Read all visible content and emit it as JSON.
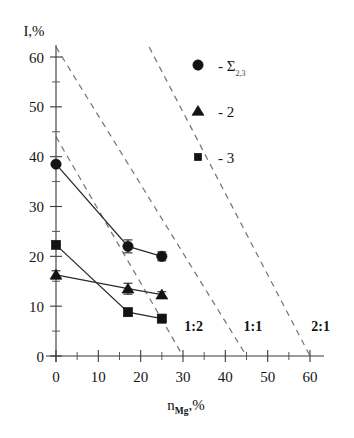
{
  "chart_data": {
    "type": "scatter",
    "title": "",
    "xlabel": "n_Mg,%",
    "xlabel_main": "n",
    "xlabel_sub": "Mg",
    "xlabel_tail": ",%",
    "ylabel": "I,%",
    "xlim": [
      0,
      60
    ],
    "ylim": [
      0,
      60
    ],
    "xticks": [
      0,
      10,
      20,
      30,
      40,
      50,
      60
    ],
    "yticks": [
      0,
      10,
      20,
      30,
      40,
      50,
      60
    ],
    "xtick_labels": [
      "0",
      "10",
      "20",
      "30",
      "40",
      "50",
      "60"
    ],
    "ytick_labels": [
      "0",
      "10",
      "20",
      "30",
      "40",
      "50",
      "60"
    ],
    "minor_tick_step": 5,
    "grid": false,
    "legend_position": "upper-right",
    "series": [
      {
        "name": "Σ",
        "name_sub": "2,3",
        "marker": "circle",
        "x": [
          0,
          17,
          25
        ],
        "values": [
          38.5,
          22.0,
          20.0
        ],
        "yerr": [
          0,
          1.3,
          0.9
        ]
      },
      {
        "name": "2",
        "marker": "triangle",
        "x": [
          0,
          17,
          25
        ],
        "values": [
          16.3,
          13.5,
          12.3
        ],
        "yerr": [
          0.8,
          1.1,
          0.6
        ]
      },
      {
        "name": "3",
        "marker": "square",
        "x": [
          0,
          17,
          25
        ],
        "values": [
          22.3,
          8.8,
          7.5
        ],
        "yerr": [
          0,
          0.7,
          0.5
        ]
      }
    ],
    "reference_lines": [
      {
        "label": "1:2",
        "x": [
          0,
          30
        ],
        "y": [
          44,
          0
        ],
        "label_x": 32.5,
        "label_y": 5.0,
        "style": "dashed"
      },
      {
        "label": "1:1",
        "x": [
          0,
          45
        ],
        "y": [
          62,
          0
        ],
        "label_x": 46.5,
        "label_y": 5.0,
        "style": "dashed"
      },
      {
        "label": "2:1",
        "x": [
          22,
          60
        ],
        "y": [
          62,
          0
        ],
        "label_x": 62.5,
        "label_y": 5.0,
        "style": "dashed"
      }
    ]
  },
  "legend": {
    "items": [
      {
        "marker": "circle",
        "dash": "-",
        "label": "Σ",
        "sub": "2,3"
      },
      {
        "marker": "triangle",
        "dash": "-",
        "label": "2",
        "sub": ""
      },
      {
        "marker": "square",
        "dash": "-",
        "label": "3",
        "sub": ""
      }
    ]
  }
}
